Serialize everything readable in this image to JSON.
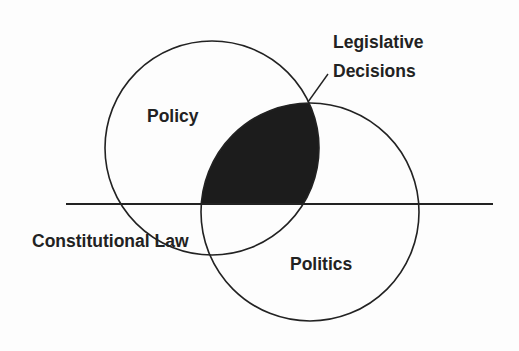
{
  "diagram": {
    "type": "venn",
    "colors": {
      "background": "#fdfdfd",
      "stroke": "#222222",
      "intersection_fill": "#1c1c1c",
      "text": "#222222"
    },
    "circles": [
      {
        "id": "policy",
        "label": "Policy",
        "cx": 212,
        "cy": 148,
        "r": 107
      },
      {
        "id": "politics",
        "label": "Politics",
        "cx": 310,
        "cy": 212,
        "r": 109
      }
    ],
    "divider": {
      "label": "Constitutional Law",
      "y": 204,
      "x1": 66,
      "x2": 493
    },
    "callout": {
      "line1": "Legislative",
      "line2": "Decisions",
      "target": "intersection above divider"
    }
  }
}
